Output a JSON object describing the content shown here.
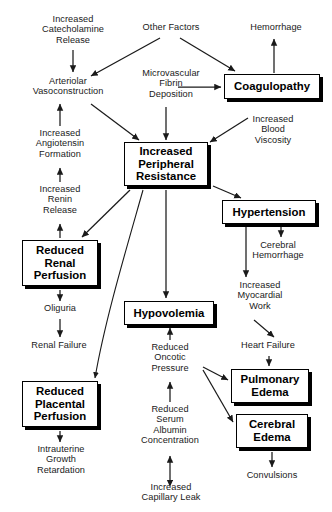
{
  "diagram": {
    "width": 332,
    "height": 512,
    "background": "#ffffff",
    "line_color": "#1a1a1a",
    "text_color": "#1a1a1a",
    "box_border_color": "#000000",
    "box_shadow_color": "#000000"
  },
  "nodes": [
    {
      "id": "catecholamine",
      "label": "Increased\nCatecholamine\nRelease",
      "style": "plain",
      "x": 21,
      "y": 14,
      "w": 104,
      "h": 36
    },
    {
      "id": "other_factors",
      "label": "Other Factors",
      "style": "plain",
      "x": 128,
      "y": 22,
      "w": 86,
      "h": 13
    },
    {
      "id": "hemorrhage",
      "label": "Hemorrhage",
      "style": "plain",
      "x": 236,
      "y": 22,
      "w": 80,
      "h": 13
    },
    {
      "id": "arteriolar",
      "label": "Arteriolar\nVasoconstruction",
      "style": "plain",
      "x": 12,
      "y": 76,
      "w": 112,
      "h": 25
    },
    {
      "id": "microvascular",
      "label": "Microvascular\nFibrin\nDeposition",
      "style": "plain",
      "x": 128,
      "y": 68,
      "w": 86,
      "h": 37
    },
    {
      "id": "coagulopathy",
      "label": "Coagulopathy",
      "style": "boxed",
      "x": 224,
      "y": 74,
      "w": 96,
      "h": 25
    },
    {
      "id": "angiotensin",
      "label": "Increased\nAngiotensin\nFormation",
      "style": "plain",
      "x": 14,
      "y": 128,
      "w": 92,
      "h": 37
    },
    {
      "id": "blood_viscosity",
      "label": "Increased\nBlood\nViscosity",
      "style": "plain",
      "x": 240,
      "y": 114,
      "w": 66,
      "h": 37
    },
    {
      "id": "ipr",
      "label": "Increased\nPeripheral\nResistance",
      "style": "boxed",
      "x": 124,
      "y": 142,
      "w": 84,
      "h": 44
    },
    {
      "id": "renin",
      "label": "Increased\nRenin\nRelease",
      "style": "plain",
      "x": 16,
      "y": 184,
      "w": 88,
      "h": 37
    },
    {
      "id": "hypertension",
      "label": "Hypertension",
      "style": "boxed",
      "x": 222,
      "y": 200,
      "w": 94,
      "h": 24
    },
    {
      "id": "renal_perf",
      "label": "Reduced\nRenal\nPerfusion",
      "style": "boxed",
      "x": 22,
      "y": 240,
      "w": 76,
      "h": 46
    },
    {
      "id": "cerebral_hem",
      "label": "Cerebral\nHemorrhage",
      "style": "plain",
      "x": 240,
      "y": 240,
      "w": 76,
      "h": 25
    },
    {
      "id": "myocardial",
      "label": "Increased\nMyocardial\nWork",
      "style": "plain",
      "x": 224,
      "y": 280,
      "w": 72,
      "h": 37
    },
    {
      "id": "oliguria",
      "label": "Oliguria",
      "style": "plain",
      "x": 28,
      "y": 303,
      "w": 64,
      "h": 13
    },
    {
      "id": "hypovolemia",
      "label": "Hypovolemia",
      "style": "boxed",
      "x": 124,
      "y": 301,
      "w": 90,
      "h": 24
    },
    {
      "id": "renal_failure",
      "label": "Renal Failure",
      "style": "plain",
      "x": 18,
      "y": 340,
      "w": 82,
      "h": 13
    },
    {
      "id": "oncotic",
      "label": "Reduced\nOncotic\nPressure",
      "style": "plain",
      "x": 137,
      "y": 342,
      "w": 66,
      "h": 37
    },
    {
      "id": "heart_failure",
      "label": "Heart Failure",
      "style": "plain",
      "x": 227,
      "y": 340,
      "w": 82,
      "h": 13
    },
    {
      "id": "pulm_edema",
      "label": "Pulmonary\nEdema",
      "style": "boxed",
      "x": 231,
      "y": 369,
      "w": 78,
      "h": 34
    },
    {
      "id": "placental_perf",
      "label": "Reduced\nPlacental\nPerfusion",
      "style": "boxed",
      "x": 22,
      "y": 381,
      "w": 76,
      "h": 46
    },
    {
      "id": "cerebral_edema",
      "label": "Cerebral\nEdema",
      "style": "boxed",
      "x": 236,
      "y": 414,
      "w": 72,
      "h": 34
    },
    {
      "id": "albumin",
      "label": "Reduced\nSerum\nAlbumin\nConcentration",
      "style": "plain",
      "x": 129,
      "y": 404,
      "w": 82,
      "h": 49
    },
    {
      "id": "iugr",
      "label": "Intrauterine\nGrowth\nRetardation",
      "style": "plain",
      "x": 20,
      "y": 444,
      "w": 82,
      "h": 37
    },
    {
      "id": "convulsions",
      "label": "Convulsions",
      "style": "plain",
      "x": 234,
      "y": 470,
      "w": 76,
      "h": 13
    },
    {
      "id": "capillary_leak",
      "label": "Increased\nCapillary Leak",
      "style": "plain",
      "x": 126,
      "y": 482,
      "w": 90,
      "h": 25
    }
  ],
  "edges": [
    {
      "from": "catecholamine",
      "to": "arteriolar",
      "kind": "arrow",
      "path": "M 73,50 L 73,72"
    },
    {
      "from": "other_factors",
      "to": "arteriolar",
      "kind": "arrow",
      "path": "M 160,38 L 91,76"
    },
    {
      "from": "other_factors",
      "to": "coagulopathy",
      "kind": "arrow",
      "path": "M 180,38 L 235,71"
    },
    {
      "from": "coagulopathy",
      "to": "hemorrhage",
      "kind": "arrow",
      "path": "M 274,73 L 274,39"
    },
    {
      "from": "microvascular",
      "to": "coagulopathy",
      "kind": "arrow",
      "path": "M 178,87 L 221,87"
    },
    {
      "from": "angiotensin",
      "to": "arteriolar",
      "kind": "arrow",
      "path": "M 60,126 L 60,104"
    },
    {
      "from": "renin",
      "to": "angiotensin",
      "kind": "arrow",
      "path": "M 60,182 L 60,168"
    },
    {
      "from": "renal_perf",
      "to": "renin",
      "kind": "arrow",
      "path": "M 60,238 L 60,224"
    },
    {
      "from": "arteriolar",
      "to": "ipr",
      "kind": "arrow",
      "path": "M 91,104 L 139,140"
    },
    {
      "from": "microvascular",
      "to": "ipr",
      "kind": "arrow",
      "path": "M 166,107 L 166,140"
    },
    {
      "from": "blood_viscosity",
      "to": "ipr",
      "kind": "arrow",
      "path": "M 248,118 L 210,142"
    },
    {
      "from": "ipr",
      "to": "hypertension",
      "kind": "arrow",
      "path": "M 213,186 L 241,198"
    },
    {
      "from": "ipr",
      "to": "renal_perf",
      "kind": "arrow",
      "path": "M 130,190 L 82,237"
    },
    {
      "from": "ipr",
      "to": "hypovolemia",
      "kind": "arrow",
      "path": "M 166,190 L 166,298"
    },
    {
      "from": "ipr",
      "to": "placental_perf",
      "kind": "curve",
      "path": "M 143,190 C 126,250 105,320 95,378"
    },
    {
      "from": "hypertension",
      "to": "myocardial",
      "kind": "arrow",
      "path": "M 246,226 L 246,277"
    },
    {
      "from": "hypertension",
      "to": "cerebral_hem",
      "kind": "arrow",
      "path": "M 281,226 L 281,237"
    },
    {
      "from": "renal_perf",
      "to": "oliguria",
      "kind": "arrow",
      "path": "M 60,290 L 60,301"
    },
    {
      "from": "oliguria",
      "to": "renal_failure",
      "kind": "arrow",
      "path": "M 60,319 L 60,337"
    },
    {
      "from": "myocardial",
      "to": "heart_failure",
      "kind": "arrow",
      "path": "M 254,320 L 274,337"
    },
    {
      "from": "heart_failure",
      "to": "pulm_edema",
      "kind": "arrow",
      "path": "M 269,356 L 269,366"
    },
    {
      "from": "oncotic",
      "to": "hypovolemia",
      "kind": "arrow",
      "path": "M 170,340 L 170,328"
    },
    {
      "from": "oncotic",
      "to": "pulm_edema",
      "kind": "arrow",
      "path": "M 203,367 L 228,380"
    },
    {
      "from": "oncotic",
      "to": "cerebral_edema",
      "kind": "arrow",
      "path": "M 203,370 L 233,422"
    },
    {
      "from": "albumin",
      "to": "oncotic",
      "kind": "arrow",
      "path": "M 170,402 L 170,382"
    },
    {
      "from": "capillary_leak",
      "to": "albumin",
      "kind": "double",
      "path": "M 170,480 L 170,456"
    },
    {
      "from": "placental_perf",
      "to": "iugr",
      "kind": "arrow",
      "path": "M 60,431 L 60,442"
    },
    {
      "from": "cerebral_edema",
      "to": "convulsions",
      "kind": "arrow",
      "path": "M 272,452 L 272,467"
    }
  ]
}
